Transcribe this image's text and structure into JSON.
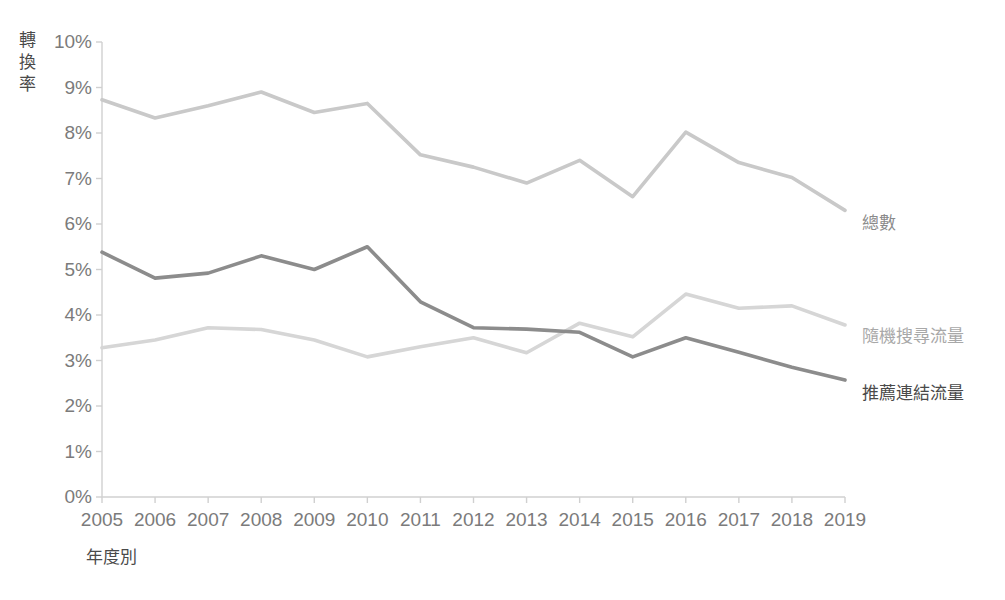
{
  "chart_data": {
    "type": "line",
    "title": "",
    "subtitle": "",
    "xlabel": "年度別",
    "ylabel": "轉換率",
    "categories": [
      2005,
      2006,
      2007,
      2008,
      2009,
      2010,
      2011,
      2012,
      2013,
      2014,
      2015,
      2016,
      2017,
      2018,
      2019
    ],
    "x_tick_labels": [
      "2005",
      "2006",
      "2007",
      "2008",
      "2009",
      "2010",
      "2011",
      "2012",
      "2013",
      "2014",
      "2015",
      "2016",
      "2017",
      "2018",
      "2019"
    ],
    "y_tick_labels": [
      "0%",
      "1%",
      "2%",
      "3%",
      "4%",
      "5%",
      "6%",
      "7%",
      "8%",
      "9%",
      "10%"
    ],
    "y_ticks": [
      0,
      1,
      2,
      3,
      4,
      5,
      6,
      7,
      8,
      9,
      10
    ],
    "ylim": [
      0,
      10
    ],
    "y_unit": "%",
    "grid": false,
    "legend_position": "right-end-labels",
    "series": [
      {
        "name": "總數",
        "color": "#c9c9c9",
        "label_color": "#8a8a8a",
        "values": [
          8.73,
          8.33,
          8.6,
          8.9,
          8.45,
          8.65,
          7.52,
          7.25,
          6.9,
          7.4,
          6.6,
          8.02,
          7.35,
          7.02,
          6.3
        ]
      },
      {
        "name": "隨機搜尋流量",
        "color": "#d6d6d6",
        "label_color": "#a8a8a8",
        "values": [
          3.28,
          3.45,
          3.72,
          3.68,
          3.45,
          3.08,
          3.3,
          3.5,
          3.17,
          3.82,
          3.52,
          4.46,
          4.15,
          4.2,
          3.78
        ]
      },
      {
        "name": "推薦連結流量",
        "color": "#8c8c8c",
        "label_color": "#4a4a4a",
        "values": [
          5.38,
          4.81,
          4.92,
          5.3,
          5.0,
          5.5,
          4.29,
          3.72,
          3.69,
          3.62,
          3.08,
          3.5,
          3.18,
          2.85,
          2.57
        ]
      }
    ],
    "series_labels": [
      {
        "text": "總數",
        "x": 862,
        "y": 209,
        "color": "#8a8a8a"
      },
      {
        "text": "隨機搜尋流量",
        "x": 862,
        "y": 322,
        "color": "#a8a8a8"
      },
      {
        "text": "推薦連結流量",
        "x": 862,
        "y": 379,
        "color": "#4a4a4a"
      }
    ],
    "axis": {
      "color": "#d0d0d0",
      "plot_left": 102,
      "plot_right": 845,
      "plot_top": 42,
      "plot_bottom": 497
    }
  }
}
